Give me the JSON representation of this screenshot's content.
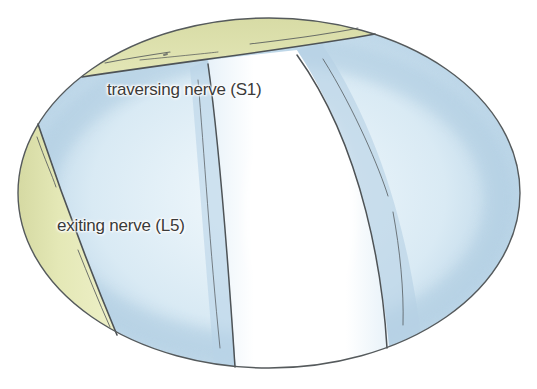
{
  "figure": {
    "labels": {
      "traversing": "traversing nerve (S1)",
      "exiting": "exiting nerve (L5)"
    },
    "colors": {
      "background": "#ffffff",
      "outline": "#555a5c",
      "yellow_tissue": "#e3e6b4",
      "yellow_tissue_edge": "#c8cc92",
      "blue_field": "#c4dcec",
      "blue_field_dark": "#a9c8de",
      "nerve_highlight": "#ffffff",
      "label_text": "#3a3a3a"
    }
  }
}
